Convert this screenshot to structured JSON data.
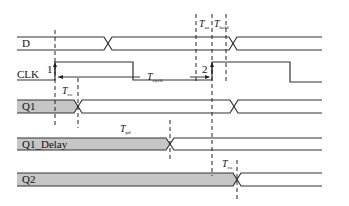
{
  "diagram": {
    "title": "",
    "signals": [
      {
        "name": "D",
        "type": "bus"
      },
      {
        "name": "CLK",
        "type": "clock"
      },
      {
        "name": "Q1",
        "type": "bus"
      },
      {
        "name": "Q1_Delay",
        "type": "bus"
      },
      {
        "name": "Q2",
        "type": "bus"
      }
    ],
    "edge_markers": [
      {
        "label": "1"
      },
      {
        "label": "2"
      }
    ],
    "timing_labels": {
      "t_co_1": {
        "main": "T",
        "sub": "co"
      },
      "t_cycle": {
        "main": "T",
        "sub": "cycle"
      },
      "t_su": {
        "main": "T",
        "sub": "su"
      },
      "t_hold": {
        "main": "T",
        "sub": "hold"
      },
      "t_pd": {
        "main": "T",
        "sub": "pd"
      },
      "t_co_2": {
        "main": "T",
        "sub": "co"
      }
    },
    "colors": {
      "line": "#333333",
      "bus_fill": "#c6c6c6",
      "background": "#ffffff"
    }
  }
}
